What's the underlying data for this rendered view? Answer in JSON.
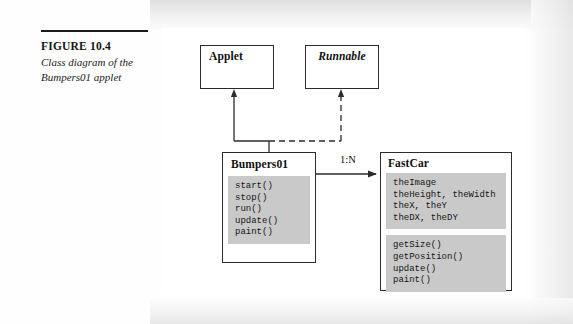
{
  "figure": {
    "number": "FIGURE 10.4",
    "caption": "Class diagram of the Bumpers01 applet"
  },
  "diagram": {
    "type": "uml-class-diagram",
    "nodes": {
      "applet": {
        "name": "Applet",
        "stereotype": "class"
      },
      "runnable": {
        "name": "Runnable",
        "stereotype": "interface"
      },
      "bumpers01": {
        "name": "Bumpers01",
        "attributes": "",
        "methods": "start()\nstop()\nrun()\nupdate()\npaint()"
      },
      "fastcar": {
        "name": "FastCar",
        "attributes": "theImage\ntheHeight, theWidth\ntheX, theY\ntheDX, theDY",
        "methods": "getSize()\ngetPosition()\nupdate()\npaint()"
      }
    },
    "relationships": {
      "extends_label": "",
      "implements_label": "",
      "association_multiplicity": "1:N"
    }
  },
  "colors": {
    "line": "#2b2b2b",
    "compartment_fill": "#c9c9c9",
    "shadow": "#9a9a9a",
    "panel": "#ffffff"
  }
}
